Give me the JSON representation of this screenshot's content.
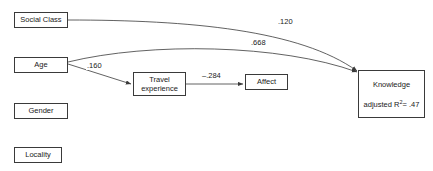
{
  "diagram": {
    "type": "path-diagram",
    "background_color": "#ffffff",
    "line_color": "#3a3a3a",
    "text_color": "#1a1a1a",
    "nodes": [
      {
        "id": "social_class",
        "label": "Social Class",
        "x": 14,
        "y": 12,
        "w": 54,
        "h": 16
      },
      {
        "id": "age",
        "label": "Age",
        "x": 14,
        "y": 57,
        "w": 54,
        "h": 16
      },
      {
        "id": "gender",
        "label": "Gender",
        "x": 14,
        "y": 103,
        "w": 54,
        "h": 16
      },
      {
        "id": "locality",
        "label": "Locality",
        "x": 14,
        "y": 147,
        "w": 48,
        "h": 16
      },
      {
        "id": "travel_experience",
        "label_line1": "Travel",
        "label_line2": "experience",
        "x": 133,
        "y": 72,
        "w": 53,
        "h": 24
      },
      {
        "id": "affect",
        "label": "Affect",
        "x": 245,
        "y": 74,
        "w": 43,
        "h": 16
      },
      {
        "id": "knowledge",
        "label": "Knowledge",
        "r2_prefix": "adjusted R",
        "r2_sup": "2",
        "r2_value": "= .47",
        "x": 358,
        "y": 70,
        "w": 67,
        "h": 48
      }
    ],
    "paths": [
      {
        "id": "social_class_to_knowledge",
        "from": "social_class",
        "to": "knowledge",
        "coefficient": ".120",
        "label_x": 277,
        "label_y": 17
      },
      {
        "id": "age_to_knowledge",
        "from": "age",
        "to": "knowledge",
        "coefficient": ".668",
        "label_x": 250,
        "label_y": 38
      },
      {
        "id": "age_to_travel_experience",
        "from": "age",
        "to": "travel_experience",
        "coefficient": ".160",
        "label_x": 86,
        "label_y": 61
      },
      {
        "id": "travel_experience_to_affect",
        "from": "travel_experience",
        "to": "affect",
        "coefficient": "–.284",
        "label_x": 201,
        "label_y": 71
      }
    ]
  }
}
